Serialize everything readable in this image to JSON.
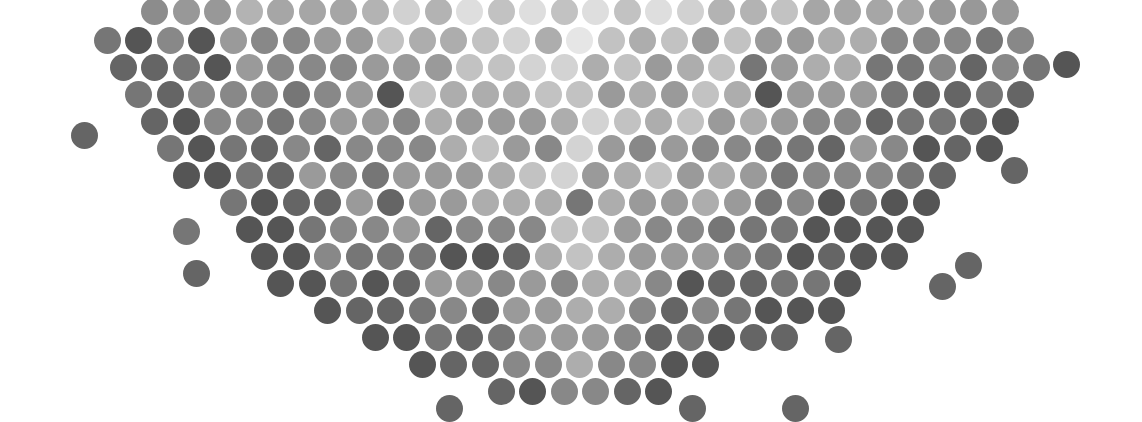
{
  "artwork": {
    "description": "Halftone field of gray circles arranged in a hexagonal grid forming a downward-tapering bowl shape; lighter in the center, darker toward edges and bottom",
    "background": "#ffffff",
    "width": 1142,
    "height": 418,
    "dot_diameter": 27,
    "grid": {
      "dx": 31.5,
      "dy": 27.2,
      "row_offset": 15.7,
      "origin_x": 60,
      "origin_y": 6
    },
    "shape": {
      "center_x": 575,
      "rows": [
        {
          "y": 6,
          "half_width": 450
        },
        {
          "y": 33,
          "half_width": 475
        },
        {
          "y": 60,
          "half_width": 470
        },
        {
          "y": 87,
          "half_width": 455
        },
        {
          "y": 114,
          "half_width": 440
        },
        {
          "y": 141,
          "half_width": 420
        },
        {
          "y": 168,
          "half_width": 395
        },
        {
          "y": 195,
          "half_width": 365
        },
        {
          "y": 222,
          "half_width": 345
        },
        {
          "y": 249,
          "half_width": 320
        },
        {
          "y": 276,
          "half_width": 300
        },
        {
          "y": 303,
          "half_width": 270
        },
        {
          "y": 330,
          "half_width": 230
        },
        {
          "y": 357,
          "half_width": 160
        },
        {
          "y": 384,
          "half_width": 90
        }
      ]
    },
    "palette": [
      "#e6e6e6",
      "#d3d3d3",
      "#c2c2c2",
      "#adadad",
      "#9a9a9a",
      "#888888",
      "#767676",
      "#656565",
      "#555555"
    ],
    "stray_dots": [
      {
        "x": 84,
        "y": 135,
        "shade": 7
      },
      {
        "x": 186,
        "y": 231,
        "shade": 6
      },
      {
        "x": 196,
        "y": 273,
        "shade": 7
      },
      {
        "x": 1014,
        "y": 170,
        "shade": 7
      },
      {
        "x": 968,
        "y": 265,
        "shade": 7
      },
      {
        "x": 942,
        "y": 286,
        "shade": 7
      },
      {
        "x": 838,
        "y": 339,
        "shade": 7
      },
      {
        "x": 795,
        "y": 408,
        "shade": 7
      },
      {
        "x": 449,
        "y": 408,
        "shade": 7
      },
      {
        "x": 692,
        "y": 408,
        "shade": 7
      },
      {
        "x": 1066,
        "y": 64,
        "shade": 8
      }
    ],
    "top_edge_fade": true
  }
}
